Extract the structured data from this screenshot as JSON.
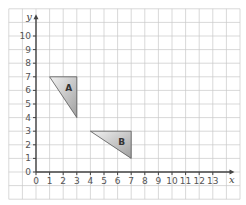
{
  "diagram": {
    "type": "coordinate-grid",
    "axes": {
      "x_label": "x",
      "y_label": "y",
      "x_ticks": [
        "0",
        "1",
        "2",
        "3",
        "4",
        "5",
        "6",
        "7",
        "8",
        "9",
        "10",
        "11",
        "12",
        "13"
      ],
      "y_ticks": [
        "0",
        "1",
        "2",
        "3",
        "4",
        "5",
        "6",
        "7",
        "8",
        "9",
        "10"
      ]
    },
    "grid": {
      "x_min": -2,
      "x_max": 15,
      "y_min": -2,
      "y_max": 12,
      "color": "#c8c8c8"
    },
    "shapes": [
      {
        "label": "A",
        "vertices": [
          [
            1,
            7
          ],
          [
            3,
            7
          ],
          [
            3,
            4
          ]
        ],
        "label_pos": [
          2.4,
          6.2
        ]
      },
      {
        "label": "B",
        "vertices": [
          [
            4,
            3
          ],
          [
            7,
            3
          ],
          [
            7,
            1
          ]
        ],
        "label_pos": [
          6.3,
          2.2
        ]
      }
    ],
    "colors": {
      "axis": "#444444",
      "shape_fill_light": "#f0f0f0",
      "shape_fill_dark": "#a8a8a8",
      "shape_stroke": "#555555"
    }
  }
}
